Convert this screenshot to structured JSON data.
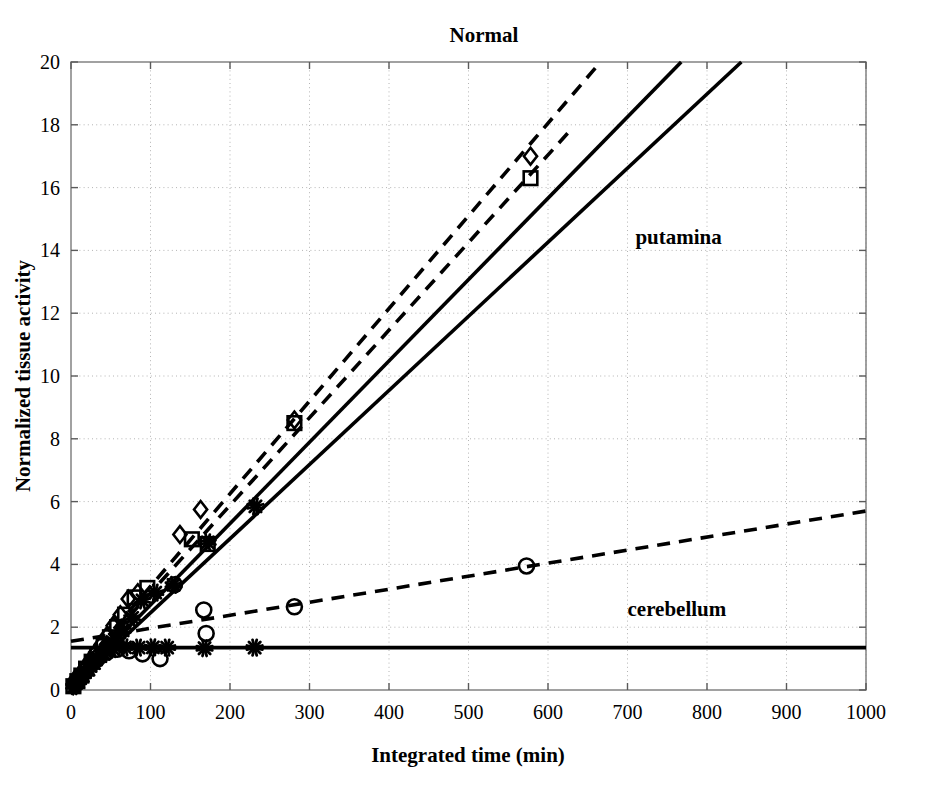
{
  "chart_data": {
    "type": "scatter",
    "title": "Normal",
    "xlabel": "Integrated time (min)",
    "ylabel": "Normalized tissue activity",
    "xlim": [
      0,
      1000
    ],
    "ylim": [
      0,
      20
    ],
    "xticks": [
      0,
      100,
      200,
      300,
      400,
      500,
      600,
      700,
      800,
      900,
      1000
    ],
    "yticks": [
      0,
      2,
      4,
      6,
      8,
      10,
      12,
      14,
      16,
      18,
      20
    ],
    "xtick_labels": [
      "0",
      "100",
      "200",
      "300",
      "400",
      "500",
      "600",
      "700",
      "800",
      "900",
      "1000"
    ],
    "ytick_labels": [
      "0",
      "2",
      "4",
      "6",
      "8",
      "10",
      "12",
      "14",
      "16",
      "18",
      "20"
    ],
    "grid": true,
    "grid_style": "dotted",
    "grid_color": "#b4b4b4",
    "legend": "none",
    "line_color": "#000000",
    "annotations": [
      {
        "text": "putamina",
        "x": 710,
        "y": 14.2
      },
      {
        "text": "cerebellum",
        "x": 700,
        "y": 2.35
      }
    ],
    "series": [
      {
        "name": "putamina-dashed-1",
        "marker": "diamond",
        "linestyle": "dashed",
        "slope": 0.0295,
        "intercept": 0.35,
        "x_end": 665,
        "points": [
          {
            "x": 3,
            "y": 0.14
          },
          {
            "x": 7,
            "y": 0.3
          },
          {
            "x": 12,
            "y": 0.5
          },
          {
            "x": 18,
            "y": 0.72
          },
          {
            "x": 24,
            "y": 0.95
          },
          {
            "x": 31,
            "y": 1.2
          },
          {
            "x": 38,
            "y": 1.45
          },
          {
            "x": 45,
            "y": 1.72
          },
          {
            "x": 53,
            "y": 2.05
          },
          {
            "x": 62,
            "y": 2.4
          },
          {
            "x": 72,
            "y": 2.9
          },
          {
            "x": 84,
            "y": 3.1
          },
          {
            "x": 137,
            "y": 4.95
          },
          {
            "x": 163,
            "y": 5.75
          },
          {
            "x": 281,
            "y": 8.6
          },
          {
            "x": 578,
            "y": 17.0
          }
        ]
      },
      {
        "name": "putamina-dashed-2",
        "marker": "square",
        "linestyle": "dashed",
        "slope": 0.0279,
        "intercept": 0.3,
        "x_end": 632,
        "points": [
          {
            "x": 3,
            "y": 0.12
          },
          {
            "x": 8,
            "y": 0.28
          },
          {
            "x": 13,
            "y": 0.46
          },
          {
            "x": 19,
            "y": 0.68
          },
          {
            "x": 26,
            "y": 0.9
          },
          {
            "x": 33,
            "y": 1.12
          },
          {
            "x": 41,
            "y": 1.4
          },
          {
            "x": 49,
            "y": 1.68
          },
          {
            "x": 58,
            "y": 2.0
          },
          {
            "x": 68,
            "y": 2.4
          },
          {
            "x": 80,
            "y": 2.95
          },
          {
            "x": 96,
            "y": 3.25
          },
          {
            "x": 152,
            "y": 4.8
          },
          {
            "x": 172,
            "y": 4.65
          },
          {
            "x": 281,
            "y": 8.5
          },
          {
            "x": 578,
            "y": 16.3
          }
        ]
      },
      {
        "name": "putamina-solid-1",
        "marker": "asterisk",
        "linestyle": "solid",
        "slope": 0.0259,
        "intercept": 0.12,
        "x_end": 768,
        "points": [
          {
            "x": 4,
            "y": 0.12
          },
          {
            "x": 9,
            "y": 0.26
          },
          {
            "x": 15,
            "y": 0.45
          },
          {
            "x": 22,
            "y": 0.65
          },
          {
            "x": 29,
            "y": 0.86
          },
          {
            "x": 37,
            "y": 1.08
          },
          {
            "x": 46,
            "y": 1.32
          },
          {
            "x": 55,
            "y": 1.6
          },
          {
            "x": 65,
            "y": 1.9
          },
          {
            "x": 77,
            "y": 2.3
          },
          {
            "x": 90,
            "y": 2.85
          },
          {
            "x": 106,
            "y": 3.1
          },
          {
            "x": 129,
            "y": 3.35
          },
          {
            "x": 172,
            "y": 4.7
          },
          {
            "x": 232,
            "y": 5.85
          }
        ]
      },
      {
        "name": "putamina-solid-2",
        "marker": "none",
        "linestyle": "solid",
        "slope": 0.0236,
        "intercept": 0.1,
        "x_end": 866,
        "points": []
      },
      {
        "name": "cerebellum-dashed",
        "marker": "circle",
        "linestyle": "dashed",
        "slope": 0.00415,
        "intercept": 1.55,
        "x_end": 1000,
        "points": [
          {
            "x": 5,
            "y": 0.2
          },
          {
            "x": 11,
            "y": 0.42
          },
          {
            "x": 18,
            "y": 0.62
          },
          {
            "x": 26,
            "y": 0.85
          },
          {
            "x": 35,
            "y": 1.05
          },
          {
            "x": 45,
            "y": 1.2
          },
          {
            "x": 58,
            "y": 1.3
          },
          {
            "x": 73,
            "y": 1.25
          },
          {
            "x": 90,
            "y": 1.15
          },
          {
            "x": 112,
            "y": 1.0
          },
          {
            "x": 130,
            "y": 3.35
          },
          {
            "x": 167,
            "y": 2.55
          },
          {
            "x": 170,
            "y": 1.8
          },
          {
            "x": 281,
            "y": 2.65
          },
          {
            "x": 573,
            "y": 3.95
          }
        ]
      },
      {
        "name": "cerebellum-solid",
        "marker": "asterisk",
        "linestyle": "solid",
        "slope": 0.0,
        "intercept": 1.35,
        "x_end": 1000,
        "points": [
          {
            "x": 6,
            "y": 0.22
          },
          {
            "x": 13,
            "y": 0.45
          },
          {
            "x": 21,
            "y": 0.68
          },
          {
            "x": 30,
            "y": 0.95
          },
          {
            "x": 41,
            "y": 1.15
          },
          {
            "x": 53,
            "y": 1.3
          },
          {
            "x": 68,
            "y": 1.36
          },
          {
            "x": 85,
            "y": 1.35
          },
          {
            "x": 103,
            "y": 1.36
          },
          {
            "x": 121,
            "y": 1.35
          },
          {
            "x": 168,
            "y": 1.33
          },
          {
            "x": 231,
            "y": 1.35
          }
        ]
      }
    ]
  }
}
